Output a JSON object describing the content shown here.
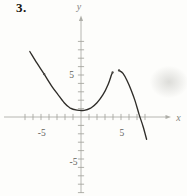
{
  "problem": {
    "number": "3."
  },
  "axes": {
    "x_label": "x",
    "y_label": "y",
    "x_tick_labels": [
      {
        "value": -5,
        "text": "-5"
      },
      {
        "value": 5,
        "text": "5"
      }
    ],
    "y_tick_labels": [
      {
        "value": 5,
        "text": "5"
      },
      {
        "value": -5,
        "text": "-5"
      }
    ]
  },
  "chart_data": {
    "type": "line",
    "title": "",
    "xlabel": "x",
    "ylabel": "y",
    "xlim": [
      -9.6,
      11.2
    ],
    "ylim": [
      -9.5,
      12.0
    ],
    "grid": false,
    "tick_interval": 1,
    "labeled_ticks": {
      "x": [
        -5,
        5
      ],
      "y": [
        5,
        -5
      ]
    },
    "x_tick_range": [
      -7,
      8
    ],
    "y_tick_range": [
      -9,
      9
    ],
    "series": [
      {
        "name": "left-branch",
        "points": [
          [
            -6.4,
            7.8
          ],
          [
            -5.5,
            6.4
          ],
          [
            -4.6,
            5.1
          ],
          [
            -3.6,
            3.6
          ],
          [
            -2.9,
            2.7
          ],
          [
            -2.1,
            1.7
          ],
          [
            -1.4,
            1.1
          ],
          [
            -0.5,
            0.82
          ],
          [
            0.4,
            0.8
          ],
          [
            1.2,
            1.05
          ],
          [
            2.0,
            1.7
          ],
          [
            2.75,
            2.65
          ],
          [
            3.4,
            3.9
          ],
          [
            3.8,
            5.0
          ],
          [
            3.95,
            5.3
          ]
        ]
      },
      {
        "name": "right-branch",
        "points": [
          [
            4.75,
            5.55
          ],
          [
            5.25,
            5.2
          ],
          [
            5.75,
            4.35
          ],
          [
            6.25,
            3.25
          ],
          [
            6.75,
            1.95
          ],
          [
            7.25,
            0.35
          ],
          [
            7.75,
            -1.1
          ],
          [
            8.2,
            -2.65
          ]
        ]
      }
    ],
    "point_markers": [
      [
        -4.6,
        5.1
      ],
      [
        3.95,
        5.3
      ],
      [
        4.75,
        5.55
      ]
    ]
  },
  "colors": {
    "background": "#fdfdfb",
    "axis": "#aeaea8",
    "tick": "#a3a39d",
    "tick_label": "#62625c",
    "axis_label": "#84847e",
    "curve": "#2f2d29",
    "marker": "#4c4a46",
    "problem_number": "#17140f"
  }
}
